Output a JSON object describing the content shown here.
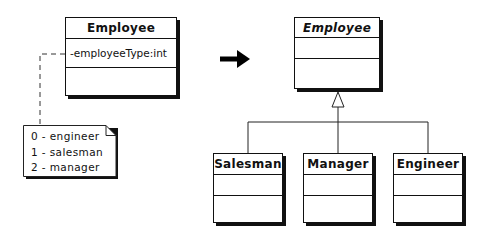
{
  "diagram": {
    "type": "uml-class-refactoring",
    "before": {
      "class": {
        "name": "Employee",
        "abstract": false,
        "attributes": [
          "-employeeType:int"
        ],
        "methods": []
      },
      "note": {
        "lines": [
          "0 - engineer",
          "1 - salesman",
          "2 - manager"
        ]
      }
    },
    "transition_arrow": "right-arrow",
    "after": {
      "superclass": {
        "name": "Employee",
        "abstract": true,
        "attributes": [],
        "methods": []
      },
      "subclasses": [
        {
          "name": "Salesman",
          "attributes": [],
          "methods": []
        },
        {
          "name": "Manager",
          "attributes": [],
          "methods": []
        },
        {
          "name": "Engineer",
          "attributes": [],
          "methods": []
        }
      ],
      "relationship": "generalization"
    }
  }
}
